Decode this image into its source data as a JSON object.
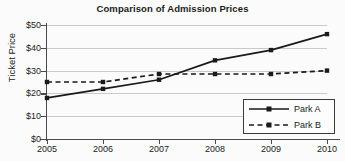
{
  "chart_data": {
    "type": "line",
    "title": "Comparison of Admission Prices",
    "xlabel": "",
    "ylabel": "Ticket Price",
    "categories": [
      "2005",
      "2006",
      "2007",
      "2008",
      "2009",
      "2010"
    ],
    "x": [
      2005,
      2006,
      2007,
      2008,
      2009,
      2010
    ],
    "xlim": [
      2005,
      2010
    ],
    "ylim": [
      0,
      50
    ],
    "y_ticks": [
      0,
      10,
      20,
      30,
      40,
      50
    ],
    "y_tick_labels": [
      "$0",
      "$10",
      "$20",
      "$30",
      "$40",
      "$50"
    ],
    "grid": true,
    "legend_position": "bottom-right",
    "series": [
      {
        "name": "Park A",
        "style": "solid",
        "marker": "square",
        "color": "#1a1a1a",
        "values": [
          18,
          22,
          26,
          34.5,
          39,
          46
        ]
      },
      {
        "name": "Park B",
        "style": "dashed",
        "marker": "square",
        "color": "#1a1a1a",
        "values": [
          25,
          25,
          28.5,
          28.5,
          28.5,
          30
        ]
      }
    ]
  },
  "legend": {
    "entries": [
      {
        "label": "Park A"
      },
      {
        "label": "Park B"
      }
    ]
  }
}
